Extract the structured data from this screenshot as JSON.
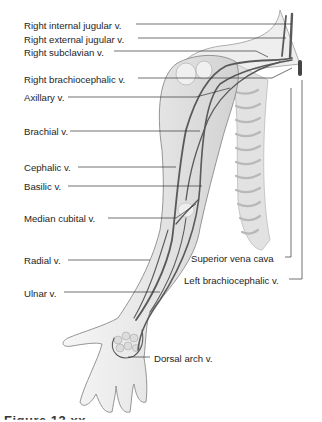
{
  "figure": {
    "caption_partial": "Figure 13.xx"
  },
  "labels_left": [
    {
      "id": "right-internal-jugular",
      "text": "Right internal jugular v.",
      "x": 24,
      "y": 20
    },
    {
      "id": "right-external-jugular",
      "text": "Right external jugular v.",
      "x": 24,
      "y": 34
    },
    {
      "id": "right-subclavian",
      "text": "Right subclavian v.",
      "x": 24,
      "y": 47
    },
    {
      "id": "right-brachiocephalic",
      "text": "Right brachiocephalic v.",
      "x": 24,
      "y": 74
    },
    {
      "id": "axillary",
      "text": "Axillary v.",
      "x": 24,
      "y": 92
    },
    {
      "id": "brachial",
      "text": "Brachial v.",
      "x": 24,
      "y": 126
    },
    {
      "id": "cephalic",
      "text": "Cephalic v.",
      "x": 24,
      "y": 162
    },
    {
      "id": "basilic",
      "text": "Basilic v.",
      "x": 24,
      "y": 181
    },
    {
      "id": "median-cubital",
      "text": "Median cubital v.",
      "x": 24,
      "y": 213
    },
    {
      "id": "radial",
      "text": "Radial v.",
      "x": 24,
      "y": 255
    },
    {
      "id": "ulnar",
      "text": "Ulnar v.",
      "x": 24,
      "y": 288
    }
  ],
  "labels_right": [
    {
      "id": "superior-vena-cava",
      "text": "Superior vena cava",
      "x": 191,
      "y": 253
    },
    {
      "id": "left-brachiocephalic",
      "text": "Left brachiocephalic v.",
      "x": 184,
      "y": 275
    },
    {
      "id": "dorsal-arch",
      "text": "Dorsal arch v.",
      "x": 154,
      "y": 353
    }
  ],
  "leader_lines": [
    {
      "id": "right-internal-jugular",
      "points": [
        [
          136,
          24
        ],
        [
          292,
          24
        ]
      ]
    },
    {
      "id": "right-external-jugular",
      "points": [
        [
          138,
          38
        ],
        [
          286,
          38
        ]
      ]
    },
    {
      "id": "right-subclavian",
      "points": [
        [
          114,
          51
        ],
        [
          256,
          51
        ],
        [
          268,
          57
        ]
      ]
    },
    {
      "id": "right-brachiocephalic",
      "points": [
        [
          138,
          78
        ],
        [
          272,
          78
        ],
        [
          292,
          68
        ]
      ]
    },
    {
      "id": "axillary",
      "points": [
        [
          68,
          97
        ],
        [
          196,
          97
        ],
        [
          230,
          88
        ]
      ]
    },
    {
      "id": "brachial",
      "points": [
        [
          70,
          131
        ],
        [
          200,
          131
        ]
      ]
    },
    {
      "id": "cephalic",
      "points": [
        [
          78,
          167
        ],
        [
          176,
          167
        ]
      ]
    },
    {
      "id": "basilic",
      "points": [
        [
          68,
          186
        ],
        [
          202,
          186
        ]
      ]
    },
    {
      "id": "median-cubital",
      "points": [
        [
          108,
          218
        ],
        [
          176,
          218
        ],
        [
          196,
          204
        ]
      ]
    },
    {
      "id": "radial",
      "points": [
        [
          68,
          260
        ],
        [
          150,
          260
        ]
      ]
    },
    {
      "id": "ulnar",
      "points": [
        [
          64,
          292
        ],
        [
          160,
          292
        ]
      ]
    },
    {
      "id": "superior-vena-cava",
      "points": [
        [
          285,
          257
        ],
        [
          291,
          257
        ],
        [
          291,
          88
        ]
      ]
    },
    {
      "id": "left-brachiocephalic",
      "points": [
        [
          289,
          279
        ],
        [
          302,
          279
        ],
        [
          302,
          80
        ]
      ]
    },
    {
      "id": "dorsal-arch",
      "points": [
        [
          128,
          357
        ],
        [
          150,
          357
        ]
      ]
    }
  ],
  "colors": {
    "background": "#ffffff",
    "skin_outline": "#8a8a8a",
    "skin_fill": "#ececec",
    "vein": "#5a5a5a",
    "leader": "#333333",
    "text": "#1e1e1e"
  }
}
